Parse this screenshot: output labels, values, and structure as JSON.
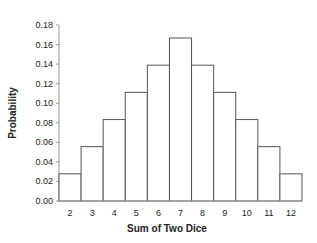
{
  "chart_data": {
    "type": "bar",
    "title": "",
    "xlabel": "Sum of Two Dice",
    "ylabel": "Probability",
    "categories": [
      "2",
      "3",
      "4",
      "5",
      "6",
      "7",
      "8",
      "9",
      "10",
      "11",
      "12"
    ],
    "values": [
      0.0278,
      0.0556,
      0.0833,
      0.1111,
      0.1389,
      0.1667,
      0.1389,
      0.1111,
      0.0833,
      0.0556,
      0.0278
    ],
    "ylim": [
      0,
      0.18
    ],
    "yticks": [
      "0.00",
      "0.02",
      "0.04",
      "0.06",
      "0.08",
      "0.10",
      "0.12",
      "0.14",
      "0.16",
      "0.18"
    ],
    "grid": false,
    "legend": null,
    "bar_fill": "#ffffff",
    "bar_stroke": "#555555",
    "axis_color": "#999999"
  }
}
